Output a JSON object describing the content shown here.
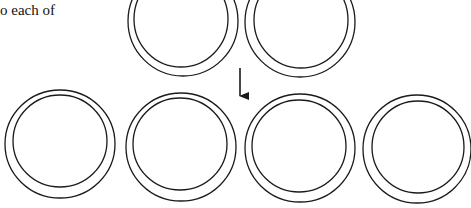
{
  "caption": "o each of",
  "figure": {
    "top_row_count": 2,
    "bottom_row_count": 4,
    "arrow_direction": "down",
    "stroke_color": "#1a1a1a"
  }
}
